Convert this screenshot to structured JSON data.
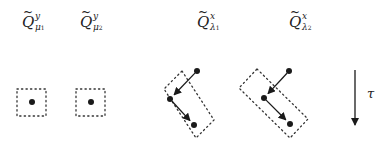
{
  "diagram": {
    "labels": [
      {
        "id": "q-y-mu1",
        "base": "Q",
        "tilde": "~",
        "sup": "y",
        "sub": "μ",
        "sub_index": "1",
        "x": 22,
        "y": 10
      },
      {
        "id": "q-y-mu2",
        "base": "Q",
        "tilde": "~",
        "sup": "y",
        "sub": "μ",
        "sub_index": "2",
        "x": 80,
        "y": 10
      },
      {
        "id": "q-x-lambda1",
        "base": "Q",
        "tilde": "~",
        "sup": "x",
        "sub": "λ",
        "sub_index": "1",
        "x": 197,
        "y": 10
      },
      {
        "id": "q-x-lambda2",
        "base": "Q",
        "tilde": "~",
        "sup": "x",
        "sub": "λ",
        "sub_index": "2",
        "x": 289,
        "y": 10
      }
    ],
    "time_axis": {
      "label": "τ",
      "direction": "down"
    },
    "square_boxes": [
      {
        "x": 17,
        "y": 89,
        "w": 29,
        "h": 27,
        "dot": [
          32,
          102
        ]
      },
      {
        "x": 76,
        "y": 89,
        "w": 29,
        "h": 27,
        "dot": [
          91,
          102
        ]
      }
    ],
    "tilted_groups": [
      {
        "box": [
          [
            182,
            71
          ],
          [
            214,
            120
          ],
          [
            196,
            138
          ],
          [
            164,
            89
          ]
        ],
        "dots": [
          [
            197,
            71
          ],
          [
            170,
            99
          ],
          [
            194,
            125
          ]
        ],
        "arrows": [
          [
            0,
            1
          ],
          [
            1,
            2
          ]
        ]
      },
      {
        "box": [
          [
            257,
            69
          ],
          [
            308,
            119
          ],
          [
            290,
            138
          ],
          [
            239,
            88
          ]
        ],
        "dots": [
          [
            289,
            71
          ],
          [
            264,
            98
          ],
          [
            290,
            124
          ]
        ],
        "arrows": [
          [
            0,
            1
          ],
          [
            1,
            2
          ]
        ]
      }
    ],
    "colors": {
      "ink": "#1a1a1a",
      "dotted": "#333333",
      "background": "#ffffff"
    }
  }
}
